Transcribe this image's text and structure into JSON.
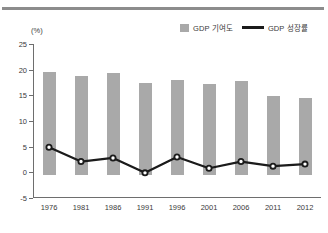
{
  "figure": {
    "unit_label": "(%)",
    "top_rule": true
  },
  "legend": {
    "position": "top-right",
    "items": [
      {
        "label": "GDP 기여도",
        "marker": "bar-swatch",
        "color": "#a9a9a9"
      },
      {
        "label": "GDP 성장률",
        "marker": "line-swatch",
        "color": "#1b1b1b"
      }
    ]
  },
  "chart_data": {
    "type": "bar",
    "title": "",
    "subtitle": "",
    "xlabel": "",
    "ylabel": "(%)",
    "ylim": [
      -5,
      25
    ],
    "yticks": [
      25,
      20,
      15,
      10,
      5,
      0,
      -5
    ],
    "ytick_labels": [
      "25",
      "20",
      "15",
      "10",
      "5",
      "0",
      "-5"
    ],
    "grid": false,
    "categories": [
      "1976",
      "1981",
      "1986",
      "1991",
      "1996",
      "2001",
      "2006",
      "2011",
      "2012"
    ],
    "series": [
      {
        "name": "GDP 기여도",
        "type": "bar",
        "color": "#a9a9a9",
        "baseline": -0.5,
        "values": [
          19.6,
          18.8,
          19.3,
          17.4,
          18.0,
          17.3,
          17.7,
          14.8,
          14.5
        ]
      },
      {
        "name": "GDP 성장률",
        "type": "line",
        "color": "#1b1b1b",
        "marker": "circle-open",
        "values": [
          4.9,
          2.1,
          2.8,
          -0.1,
          3.0,
          0.8,
          2.1,
          1.2,
          1.6
        ]
      }
    ]
  }
}
